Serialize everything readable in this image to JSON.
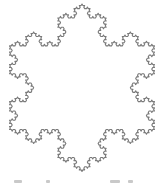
{
  "figure": {
    "name": "Koch snowflake",
    "stroke_color": "#7a7a7a",
    "background": "#ffffff",
    "iterations": 4,
    "apex": [
      82,
      4
    ],
    "side_length": 145,
    "stroke_width": 1.1
  },
  "caption": {
    "visible_fragments": [
      {
        "x": 14,
        "w": 8
      },
      {
        "x": 46,
        "w": 4
      },
      {
        "x": 110,
        "w": 10
      },
      {
        "x": 128,
        "w": 5
      }
    ]
  }
}
